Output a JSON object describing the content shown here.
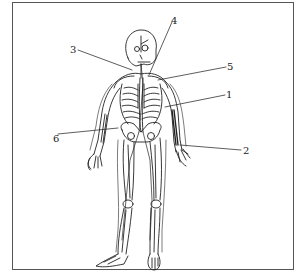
{
  "diagram": {
    "labels": [
      {
        "id": "1",
        "text": "1",
        "x": 226,
        "y": 90
      },
      {
        "id": "2",
        "text": "2",
        "x": 243,
        "y": 146
      },
      {
        "id": "3",
        "text": "3",
        "x": 70,
        "y": 45
      },
      {
        "id": "4",
        "text": "4",
        "x": 171,
        "y": 16
      },
      {
        "id": "5",
        "text": "5",
        "x": 227,
        "y": 62
      },
      {
        "id": "6",
        "text": "6",
        "x": 53,
        "y": 134
      }
    ],
    "colors": {
      "line": "#222222",
      "frame": "#555555",
      "background": "#ffffff"
    }
  }
}
